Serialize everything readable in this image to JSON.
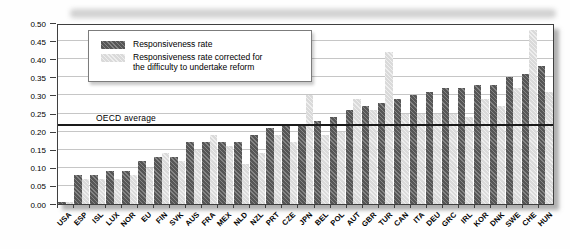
{
  "figure": {
    "background": "#fefefe",
    "frame_color": "#3f3f3f",
    "gridline_color": "#c6c6c6"
  },
  "chart_data": {
    "type": "bar",
    "title": "",
    "xlabel": "",
    "ylabel": "",
    "grid": "horizontal",
    "categories": [
      "USA",
      "ESP",
      "ISL",
      "LUX",
      "NOR",
      "EU",
      "FIN",
      "SVK",
      "AUS",
      "FRA",
      "MEX",
      "NLD",
      "NZL",
      "PRT",
      "CZE",
      "JPN",
      "BEL",
      "POL",
      "AUT",
      "GBR",
      "TUR",
      "CAN",
      "ITA",
      "DEU",
      "GRC",
      "IRL",
      "KOR",
      "DNK",
      "SWE",
      "CHE",
      "HUN"
    ],
    "series": [
      {
        "name": "Responsiveness rate",
        "color": "#565656",
        "values": [
          0.005,
          0.08,
          0.08,
          0.09,
          0.09,
          0.12,
          0.13,
          0.13,
          0.17,
          0.17,
          0.17,
          0.17,
          0.19,
          0.21,
          0.22,
          0.22,
          0.23,
          0.24,
          0.26,
          0.27,
          0.28,
          0.29,
          0.3,
          0.31,
          0.32,
          0.32,
          0.33,
          0.33,
          0.35,
          0.36,
          0.38
        ]
      },
      {
        "name": "Responsiveness rate corrected for the difficulty to undertake reform",
        "color": "#dadada",
        "values": [
          0.005,
          0.07,
          0.07,
          0.07,
          0.08,
          0.1,
          0.14,
          0.12,
          0.15,
          0.19,
          0.16,
          0.11,
          0.14,
          0.19,
          0.17,
          0.3,
          0.19,
          0.2,
          0.29,
          0.26,
          0.42,
          0.25,
          0.25,
          0.25,
          0.25,
          0.24,
          0.29,
          0.27,
          0.32,
          0.48,
          0.31
        ]
      }
    ],
    "y_axis": {
      "ticks": [
        "0.00",
        "0.05",
        "0.10",
        "0.15",
        "0.20",
        "0.25",
        "0.30",
        "0.35",
        "0.40",
        "0.45",
        "0.50"
      ],
      "ylim": [
        0,
        0.5
      ]
    },
    "reference_line": {
      "label": "OECD average",
      "value": 0.215
    },
    "legend": {
      "position": "top-left",
      "entry1_label": "Responsiveness rate",
      "entry2_line1": "Responsiveness rate corrected for",
      "entry2_line2": "the difficulty to undertake reform"
    }
  }
}
